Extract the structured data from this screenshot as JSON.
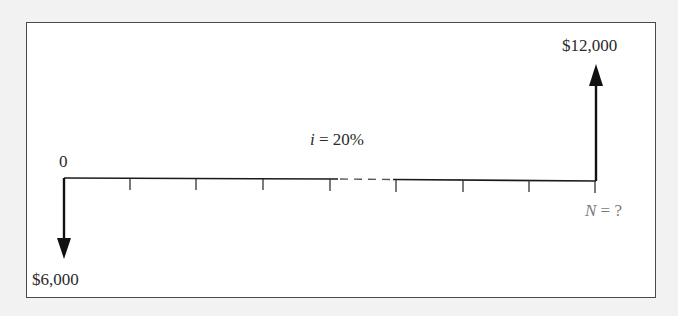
{
  "diagram": {
    "type": "cash-flow-diagram",
    "interest_rate": {
      "variable": "i",
      "operator": " = ",
      "value": "20%"
    },
    "start_period_label": "0",
    "end_period": {
      "variable": "N",
      "operator": " = ",
      "value": "?"
    },
    "cash_flows": [
      {
        "period": "0",
        "direction": "outflow",
        "arrow": "down",
        "label": "$6,000"
      },
      {
        "period": "N",
        "direction": "inflow",
        "arrow": "up",
        "label": "$12,000"
      }
    ],
    "timeline": {
      "tick_count": 8,
      "has_dashed_gap": true,
      "dashed_gap_between_ticks": [
        4,
        5
      ]
    },
    "colors": {
      "line": "#1a1a1a",
      "frame_border": "#4a4a4a",
      "background": "#f2f2f2",
      "panel": "#ffffff",
      "muted_label": "#7a7a7a"
    }
  }
}
